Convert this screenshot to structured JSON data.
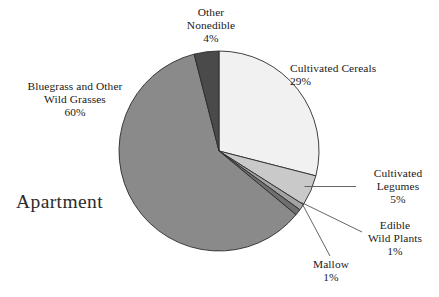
{
  "watermark": {
    "text": "Apartment"
  },
  "chart_data": {
    "type": "pie",
    "title": "",
    "subtitle": "",
    "xlabel": "",
    "ylabel": "",
    "legend_position": "none",
    "grid": false,
    "units": "percent",
    "total": 100,
    "start_angle_deg": 0,
    "direction": "clockwise",
    "center": {
      "x": 219,
      "y": 151
    },
    "radius": 100,
    "categories": [
      "Cultivated Cereals",
      "Cultivated Legumes",
      "Edible Wild Plants",
      "Mallow",
      "Bluegrass and Other Wild Grasses",
      "Other Nonedible"
    ],
    "values": [
      29,
      5,
      1,
      1,
      60,
      4
    ],
    "colors": [
      "#f1f1f1",
      "#c9c9c9",
      "#a3a3a3",
      "#6f6f6f",
      "#8a8a8a",
      "#4a4a4a"
    ],
    "slices": [
      {
        "name": "Cultivated Cereals",
        "value": 29,
        "label": "Cultivated Cereals",
        "percent_label": "29%",
        "color": "#f1f1f1",
        "leader": false
      },
      {
        "name": "Cultivated Legumes",
        "value": 5,
        "label_line1": "Cultivated",
        "label_line2": "Legumes",
        "percent_label": "5%",
        "color": "#c9c9c9",
        "leader": true
      },
      {
        "name": "Edible Wild Plants",
        "value": 1,
        "label_line1": "Edible",
        "label_line2": "Wild Plants",
        "percent_label": "1%",
        "color": "#a3a3a3",
        "leader": true
      },
      {
        "name": "Mallow",
        "value": 1,
        "label": "Mallow",
        "percent_label": "1%",
        "color": "#6f6f6f",
        "leader": true
      },
      {
        "name": "Bluegrass and Other Wild Grasses",
        "value": 60,
        "label_line1": "Bluegrass and Other",
        "label_line2": "Wild Grasses",
        "percent_label": "60%",
        "color": "#8a8a8a",
        "leader": false
      },
      {
        "name": "Other Nonedible",
        "value": 4,
        "label_line1": "Other",
        "label_line2": "Nonedible",
        "percent_label": "4%",
        "color": "#4a4a4a",
        "leader": false
      }
    ]
  }
}
